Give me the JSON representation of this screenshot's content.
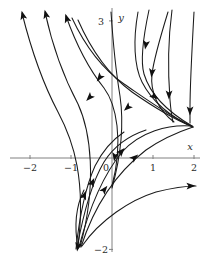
{
  "figure": {
    "kind": "phase-portrait",
    "background_color": "#ffffff",
    "axis_color": "#808080",
    "curve_color": "#1a1a1a",
    "label_color": "#2b2b2b"
  },
  "axes": {
    "x_axis_label": "x",
    "y_axis_label": "y",
    "x_ticks": [
      {
        "label": "−2",
        "value": -2
      },
      {
        "label": "−1",
        "value": -1
      },
      {
        "label": "0",
        "value": 0
      },
      {
        "label": "1",
        "value": 1
      },
      {
        "label": "2",
        "value": 2
      }
    ],
    "y_ticks": [
      {
        "label": "3",
        "value": 3
      },
      {
        "label": "−2",
        "value": -2
      }
    ],
    "x_range": [
      -2.45,
      2.4
    ],
    "y_range": [
      -2.3,
      3.2
    ],
    "grid": false
  },
  "chart_data": {
    "type": "line",
    "title": "",
    "xlabel": "x",
    "ylabel": "y",
    "xlim": [
      -2.45,
      2.4
    ],
    "ylim": [
      -2.3,
      3.2
    ],
    "grid": false,
    "legend": "none",
    "series": [
      {
        "name": "trajectory-1",
        "path": "M 22 13 C 30 45 40 78 58 112 C 74 142 86 180 78 247",
        "arrows": [
          {
            "x": 23,
            "y": 16,
            "angle": -104
          }
        ]
      },
      {
        "name": "trajectory-2",
        "path": "M 45 12 C 52 44 62 74 78 104 C 90 130 98 182 80 247",
        "arrows": [
          {
            "x": 46,
            "y": 15,
            "angle": -104
          }
        ]
      },
      {
        "name": "trajectory-3",
        "path": "M 66 16 C 76 44 88 68 104 88 C 116 104 124 140 112 186",
        "arrows": [
          {
            "x": 67,
            "y": 19,
            "angle": -108
          }
        ]
      },
      {
        "name": "trajectory-4",
        "path": "M 72 18 C 86 48 104 70 124 84 C 146 99 172 118 193 127",
        "arrows": [
          {
            "x": 90,
            "y": 97,
            "angle": 134
          },
          {
            "x": 100,
            "y": 77,
            "angle": 126
          }
        ]
      },
      {
        "name": "trajectory-5",
        "path": "M 78 20 C 92 52 110 76 132 92 C 152 106 176 120 193 127",
        "arrows": [
          {
            "x": 128,
            "y": 107,
            "angle": 138
          }
        ]
      },
      {
        "name": "trajectory-6",
        "path": "M 111 12 C 113 42 116 72 120 96 C 124 124 122 152 112 188",
        "arrows": [
          {
            "x": 115,
            "y": 156,
            "angle": 100
          }
        ]
      },
      {
        "name": "trajectory-7",
        "path": "M 138 12 C 133 40 134 66 142 82 C 152 102 172 118 192 126",
        "arrows": [
          {
            "x": 154,
            "y": 96,
            "angle": 36
          }
        ]
      },
      {
        "name": "trajectory-8",
        "path": "M 149 10 C 143 38 140 60 144 74 C 150 94 168 112 192 126",
        "arrows": [
          {
            "x": 146,
            "y": 44,
            "angle": 100
          }
        ]
      },
      {
        "name": "trajectory-9",
        "path": "M 168 12 C 160 38 154 58 152 74 C 150 92 158 110 174 122",
        "arrows": [
          {
            "x": 152,
            "y": 72,
            "angle": 97
          }
        ]
      },
      {
        "name": "trajectory-10",
        "path": "M 172 10 C 168 40 168 74 170 100 C 171 112 172 118 173 122",
        "arrows": [
          {
            "x": 169,
            "y": 94,
            "angle": 91
          }
        ]
      },
      {
        "name": "trajectory-11",
        "path": "M 194 12 C 192 48 190 84 190 108 C 190 116 190 120 190 123",
        "arrows": [
          {
            "x": 190,
            "y": 110,
            "angle": 91
          }
        ]
      },
      {
        "name": "trajectory-12",
        "path": "M 81 247 C 96 200 120 170 146 150 C 166 136 184 130 193 127",
        "arrows": [
          {
            "x": 104,
            "y": 190,
            "angle": -52
          },
          {
            "x": 134,
            "y": 158,
            "angle": -40
          }
        ]
      },
      {
        "name": "trajectory-13",
        "path": "M 79 247 C 90 205 104 174 122 152 C 140 132 168 124 192 126",
        "arrows": [
          {
            "x": 121,
            "y": 152,
            "angle": -48
          }
        ]
      },
      {
        "name": "trajectory-14",
        "path": "M 77 248 C 84 210 92 182 104 162 C 114 146 128 136 146 130",
        "arrows": [
          {
            "x": 92,
            "y": 183,
            "angle": -66
          }
        ]
      },
      {
        "name": "trajectory-15",
        "path": "M 76 249 C 80 212 86 186 95 166 C 103 150 112 140 124 132",
        "arrows": [
          {
            "x": 84,
            "y": 196,
            "angle": -70
          }
        ]
      },
      {
        "name": "trajectory-16",
        "path": "M 82 246 C 100 220 130 200 156 192 C 172 188 186 186 196 186",
        "arrows": [
          {
            "x": 190,
            "y": 186,
            "angle": -2
          }
        ]
      },
      {
        "name": "trajectory-17",
        "path": "M 78 248 C 74 226 76 206 84 190",
        "arrows": [
          {
            "x": 78,
            "y": 246,
            "angle": 100
          }
        ]
      }
    ]
  }
}
